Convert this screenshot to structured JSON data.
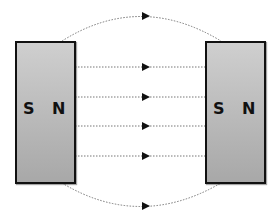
{
  "diagram": {
    "magnets": [
      {
        "id": "left",
        "poles": {
          "left": "S",
          "right": "N"
        }
      },
      {
        "id": "right",
        "poles": {
          "left": "S",
          "right": "N"
        }
      }
    ],
    "field_lines": {
      "count": 6,
      "direction": "left-to-right",
      "style": "dotted",
      "straight_y": [
        67,
        97,
        126,
        156
      ],
      "arc_top_peak_y": 16,
      "arc_bottom_peak_y": 206
    },
    "colors": {
      "magnet_fill": "#bdbdbd",
      "magnet_border": "#111111",
      "field_line": "#777777",
      "arrow": "#111111"
    }
  }
}
